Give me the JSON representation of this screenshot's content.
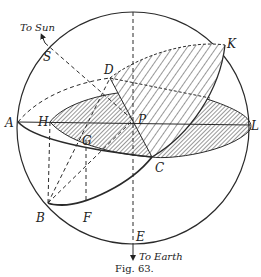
{
  "figure": {
    "caption": "Fig. 63.",
    "colors": {
      "ink": "#2a2a2a",
      "paper": "#ffffff"
    },
    "arrows": {
      "to_sun": "To Sun",
      "to_earth": "To Earth"
    },
    "points": {
      "A": "A",
      "H": "H",
      "G": "G",
      "P": "P",
      "D": "D",
      "K": "K",
      "L": "L",
      "C": "C",
      "B": "B",
      "F": "F",
      "E": "E",
      "S": "S"
    }
  }
}
